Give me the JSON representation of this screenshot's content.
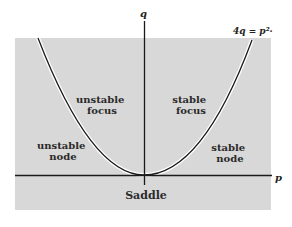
{
  "diagram": {
    "colors": {
      "background": "#ffffff",
      "region_fill": "#d8d8d8",
      "line": "#1a1a1a",
      "curve_halo": "#ffffff"
    },
    "axes": {
      "x_label": "p",
      "y_label": "q"
    },
    "curve_label": "4q = p²·",
    "regions": [
      {
        "id": "unstable-focus",
        "line1": "unstable",
        "line2": "focus"
      },
      {
        "id": "stable-focus",
        "line1": "stable",
        "line2": "focus"
      },
      {
        "id": "unstable-node",
        "line1": "unstable",
        "line2": "node"
      },
      {
        "id": "stable-node",
        "line1": "stable",
        "line2": "node"
      },
      {
        "id": "saddle",
        "line1": "Saddle"
      }
    ]
  }
}
